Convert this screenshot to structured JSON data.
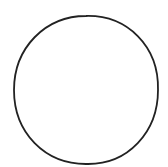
{
  "figure": {
    "shape": "circle",
    "stroke_color": "#222222",
    "fill_color": "#ffffff",
    "background": "#ffffff",
    "center": [
      86,
      90
    ],
    "radius_x": 72,
    "radius_y": 74,
    "stroke_width": 1.8
  }
}
